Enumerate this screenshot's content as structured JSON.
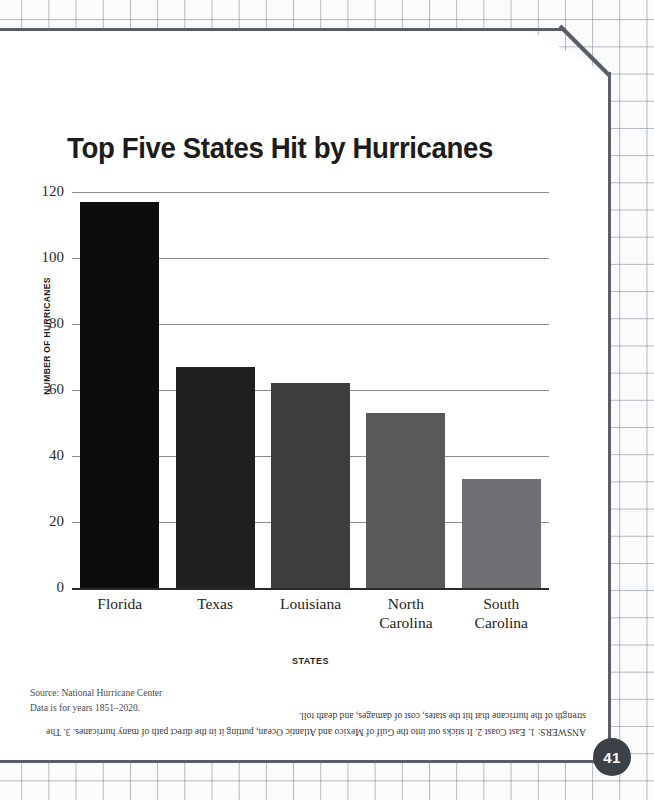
{
  "page": {
    "number": "41"
  },
  "chart_data": {
    "type": "bar",
    "title": "Top Five States Hit by Hurricanes",
    "xlabel": "STATES",
    "ylabel": "NUMBER OF HURRICANES",
    "categories": [
      "Florida",
      "Texas",
      "Louisiana",
      "North Carolina",
      "South Carolina"
    ],
    "category_lines": [
      [
        "Florida"
      ],
      [
        "Texas"
      ],
      [
        "Louisiana"
      ],
      [
        "North",
        "Carolina"
      ],
      [
        "South",
        "Carolina"
      ]
    ],
    "values": [
      117,
      67,
      62,
      53,
      33
    ],
    "ylim": [
      0,
      120
    ],
    "yticks": [
      120,
      100,
      80,
      60,
      40,
      20,
      0
    ],
    "grid": true,
    "legend": "none",
    "bar_colors": [
      "#0d0d0d",
      "#1f2022",
      "#3c3d3f",
      "#58595b",
      "#6e7073"
    ]
  },
  "source": {
    "line1": "Source: National Hurricane Center",
    "line2": "Data is for years 1851–2020."
  },
  "answers": {
    "text": "ANSWERS: 1. East Coast 2. It sticks out into the Gulf of Mexico and Atlantic Ocean, putting it in the direct path of many hurricanes. 3. The strength of the hurricane that hit the states, cost of damages, and death toll."
  }
}
